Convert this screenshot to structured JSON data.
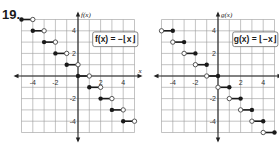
{
  "problem": {
    "number": "19."
  },
  "chart_data": [
    {
      "type": "line",
      "title": "f(x) = -⌊x⌋",
      "equation_label": "f(x) = −⌊x⌋",
      "xlabel": "x",
      "ylabel": "f(x)",
      "xlim": [
        -5,
        5
      ],
      "ylim": [
        -5,
        5
      ],
      "grid": true,
      "x_ticks": [
        -4,
        -2,
        2,
        4
      ],
      "y_ticks": [
        4,
        2,
        -2,
        -4
      ],
      "origin_px": [
        78,
        76
      ],
      "cell_px": 11.3,
      "segments": [
        {
          "x0": -5,
          "x1": -4,
          "y": 5,
          "closed_left": true,
          "open_right": true
        },
        {
          "x0": -4,
          "x1": -3,
          "y": 4,
          "closed_left": true,
          "open_right": true
        },
        {
          "x0": -3,
          "x1": -2,
          "y": 3,
          "closed_left": true,
          "open_right": true
        },
        {
          "x0": -2,
          "x1": -1,
          "y": 2,
          "closed_left": true,
          "open_right": true
        },
        {
          "x0": -1,
          "x1": 0,
          "y": 1,
          "closed_left": true,
          "open_right": true
        },
        {
          "x0": 0,
          "x1": 1,
          "y": 0,
          "closed_left": true,
          "open_right": true
        },
        {
          "x0": 1,
          "x1": 2,
          "y": -1,
          "closed_left": true,
          "open_right": true
        },
        {
          "x0": 2,
          "x1": 3,
          "y": -2,
          "closed_left": true,
          "open_right": true
        },
        {
          "x0": 3,
          "x1": 4,
          "y": -3,
          "closed_left": true,
          "open_right": true
        },
        {
          "x0": 4,
          "x1": 5,
          "y": -4,
          "closed_left": true,
          "open_right": true
        }
      ]
    },
    {
      "type": "line",
      "title": "g(x) = ⌊-x⌋",
      "equation_label": "g(x) = ⌊−x⌋",
      "xlabel": "x",
      "ylabel": "g(x)",
      "xlim": [
        -5,
        5
      ],
      "ylim": [
        -5,
        5
      ],
      "grid": true,
      "x_ticks": [
        -4,
        -2,
        2,
        4
      ],
      "y_ticks": [
        4,
        2,
        -2,
        -4
      ],
      "origin_px": [
        218,
        76
      ],
      "cell_px": 11.3,
      "segments": [
        {
          "x0": -5,
          "x1": -4,
          "y": 4,
          "open_left": true,
          "closed_right": true
        },
        {
          "x0": -4,
          "x1": -3,
          "y": 3,
          "open_left": true,
          "closed_right": true
        },
        {
          "x0": -3,
          "x1": -2,
          "y": 2,
          "open_left": true,
          "closed_right": true
        },
        {
          "x0": -2,
          "x1": -1,
          "y": 1,
          "open_left": true,
          "closed_right": true
        },
        {
          "x0": -1,
          "x1": 0,
          "y": 0,
          "open_left": true,
          "closed_right": true
        },
        {
          "x0": 0,
          "x1": 1,
          "y": -1,
          "open_left": true,
          "closed_right": true
        },
        {
          "x0": 1,
          "x1": 2,
          "y": -2,
          "open_left": true,
          "closed_right": true
        },
        {
          "x0": 2,
          "x1": 3,
          "y": -3,
          "open_left": true,
          "closed_right": true
        },
        {
          "x0": 3,
          "x1": 4,
          "y": -4,
          "open_left": true,
          "closed_right": true
        },
        {
          "x0": 4,
          "x1": 5,
          "y": -5,
          "open_left": true,
          "closed_right": true
        }
      ]
    }
  ]
}
